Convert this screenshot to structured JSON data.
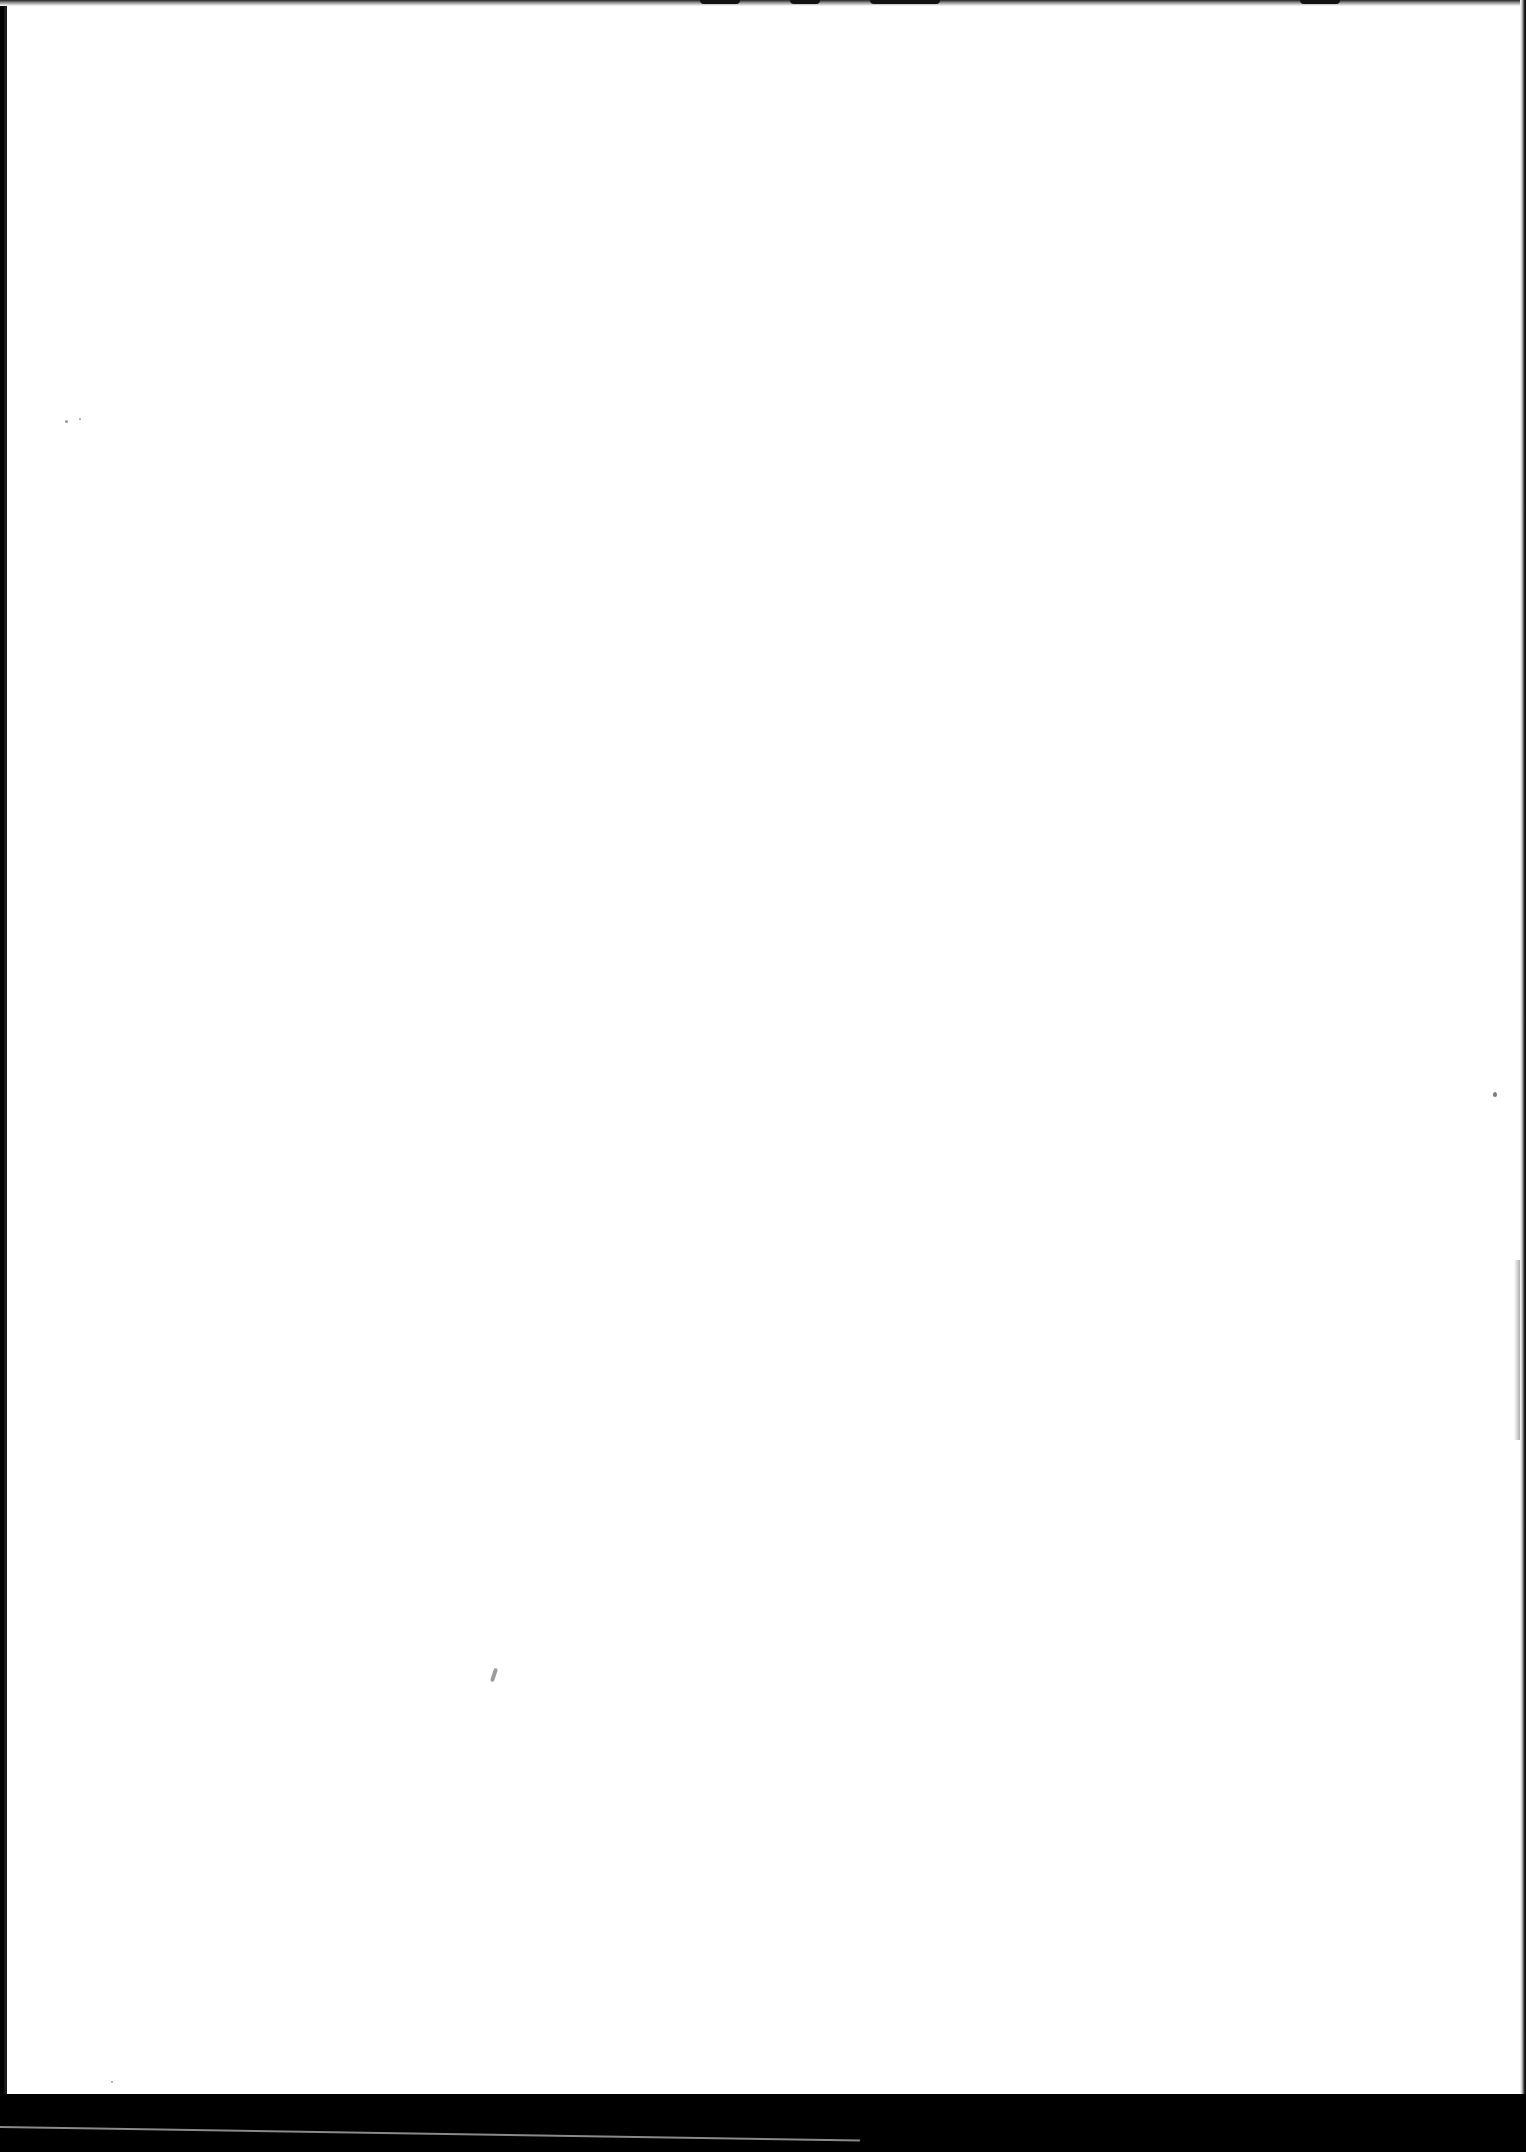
{
  "document": {
    "type": "scanned-page",
    "content": "blank",
    "page_color": "#ffffff",
    "border_color": "#000000"
  }
}
